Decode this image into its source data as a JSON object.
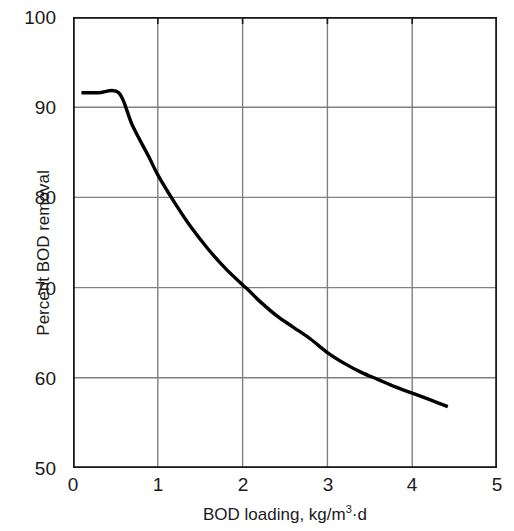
{
  "chart_data": {
    "type": "line",
    "title": "",
    "xlabel": "BOD loading, kg/m3·d",
    "xlabel_base": "BOD loading, kg/m",
    "xlabel_sup": "3",
    "xlabel_tail": "·d",
    "ylabel": "Percent BOD removal",
    "xlim": [
      0,
      5
    ],
    "ylim": [
      50,
      100
    ],
    "xticks": [
      "0",
      "1",
      "2",
      "3",
      "4",
      "5"
    ],
    "xtick_values": [
      0,
      1,
      2,
      3,
      4,
      5
    ],
    "yticks": [
      "50",
      "60",
      "70",
      "80",
      "90",
      "100"
    ],
    "ytick_values": [
      50,
      60,
      70,
      80,
      90,
      100
    ],
    "grid": true,
    "grid_color": "#808080",
    "axis_color": "#1a1a1a",
    "line_color": "#000000",
    "line_width": 3.4,
    "legend": null,
    "series": [
      {
        "name": "Percent BOD removal vs BOD loading",
        "x": [
          0.1,
          0.3,
          0.54,
          0.7,
          0.9,
          1.0,
          1.2,
          1.4,
          1.6,
          1.8,
          2.0,
          2.05,
          2.2,
          2.4,
          2.6,
          2.8,
          3.0,
          3.2,
          3.4,
          3.6,
          3.8,
          4.0,
          4.2,
          4.42
        ],
        "y": [
          91.6,
          91.6,
          91.6,
          88.0,
          84.4,
          82.5,
          79.4,
          76.6,
          74.2,
          72.1,
          70.3,
          69.9,
          68.5,
          66.9,
          65.6,
          64.3,
          62.8,
          61.6,
          60.6,
          59.8,
          59.0,
          58.3,
          57.6,
          56.8
        ]
      }
    ],
    "annotations": []
  },
  "figure": {
    "background": "#ffffff"
  }
}
